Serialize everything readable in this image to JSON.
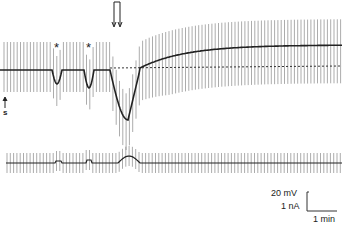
{
  "figure": {
    "markers": {
      "asterisk_1": "*",
      "asterisk_2": "*",
      "stim_label": "s",
      "application_arrow": "double-down-arrow"
    },
    "scale_bar": {
      "voltage": "20 mV",
      "current": "1 nA",
      "time": "1 min"
    }
  },
  "chart_data": {
    "type": "line",
    "title": "",
    "panels": [
      {
        "name": "membrane_potential_trace",
        "description": "Voltage trace with repeated hyperpolarizing/depolarizing current-pulse deflections; two brief transient hyperpolarizations marked by asterisks, then a large hyperpolarization after drug application (double arrow) followed by a sustained depolarization above the dashed baseline",
        "baseline_dashed": true,
        "events": [
          {
            "label": "s",
            "x_px": 7,
            "type": "stimulus-start"
          },
          {
            "label": "*",
            "x_px": 57,
            "type": "transient-hyperpolarization"
          },
          {
            "label": "*",
            "x_px": 89,
            "type": "transient-hyperpolarization"
          },
          {
            "label": "double-arrow",
            "x_px": 117,
            "type": "application"
          },
          {
            "label": "peak hyperpolarization",
            "x_px": 128
          }
        ],
        "scale": {
          "voltage": "20 mV",
          "time": "1 min"
        }
      },
      {
        "name": "current_trace",
        "description": "Current trace with regular pulses; small bumps coinciding with the asterisk events and a larger bump near the application peak",
        "scale": {
          "current": "1 nA",
          "time": "1 min"
        }
      }
    ]
  }
}
